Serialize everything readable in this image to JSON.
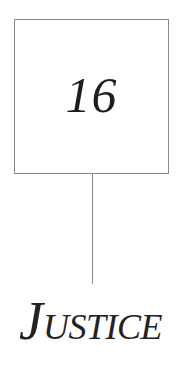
{
  "chapter": {
    "number": "16",
    "title_initial": "J",
    "title_rest": "USTICE",
    "title_full": "Justice"
  },
  "colors": {
    "background": "#ffffff",
    "border": "#8a8a8a",
    "text": "#1e1e1e"
  }
}
